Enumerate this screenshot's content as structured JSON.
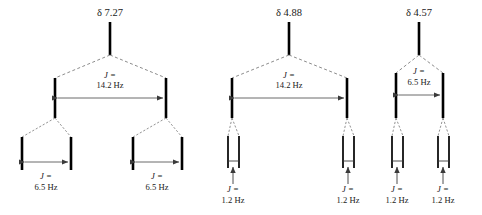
{
  "figure": {
    "kind": "nmr-splitting-tree-diagram",
    "background_color": "#ffffff",
    "line_color": "#000000",
    "dashed_color": "#777777",
    "arrow_color": "#3a3a3a",
    "width": 482,
    "height": 215
  },
  "trees": [
    {
      "id": "tree-1",
      "shift_label": "δ 7.27",
      "shift_x": 110,
      "stem": {
        "x": 110,
        "y1": 22,
        "y2": 55
      },
      "level1": {
        "j_italic": "J",
        "j_equals": "=",
        "j_value": "14.2 Hz",
        "j_line1": "J =",
        "j_line2": "14.2 Hz",
        "label_x": 110,
        "label_y1": 78,
        "label_y2": 88,
        "arrow_y": 98,
        "left_x": 55,
        "right_x": 166,
        "bar_y1": 78,
        "bar_y2": 118
      },
      "level2": [
        {
          "j_line1": "J =",
          "j_line2": "6.5 Hz",
          "label_x": 46,
          "label_y1": 179,
          "label_y2": 190,
          "arrow_y": 162,
          "left_x": 22,
          "right_x": 71,
          "bar_y1": 137,
          "bar_y2": 170
        },
        {
          "j_line1": "J =",
          "j_line2": "6.5 Hz",
          "label_x": 157,
          "label_y1": 179,
          "label_y2": 190,
          "arrow_y": 162,
          "left_x": 133,
          "right_x": 182,
          "bar_y1": 137,
          "bar_y2": 170
        }
      ]
    },
    {
      "id": "tree-2",
      "shift_label": "δ 4.88",
      "shift_x": 289,
      "stem": {
        "x": 289,
        "y1": 22,
        "y2": 55
      },
      "level1": {
        "j_line1": "J =",
        "j_line2": "14.2 Hz",
        "label_x": 289,
        "label_y1": 78,
        "label_y2": 88,
        "arrow_y": 98,
        "left_x": 232,
        "right_x": 347,
        "bar_y1": 78,
        "bar_y2": 118
      },
      "level2": [
        {
          "j_line1": "J =",
          "j_line2": "1.2 Hz",
          "label_x": 233,
          "label_y1": 192,
          "label_y2": 203,
          "arrow_y_top": 168,
          "arrow_y_bottom": 184,
          "left_x": 228,
          "right_x": 239,
          "bar_y1": 136,
          "bar_y2": 168
        },
        {
          "j_line1": "J =",
          "j_line2": "1.2 Hz",
          "label_x": 348,
          "label_y1": 192,
          "label_y2": 203,
          "arrow_y_top": 168,
          "arrow_y_bottom": 184,
          "left_x": 343,
          "right_x": 354,
          "bar_y1": 136,
          "bar_y2": 168
        }
      ]
    },
    {
      "id": "tree-3",
      "shift_label": "δ 4.57",
      "shift_x": 419,
      "stem": {
        "x": 419,
        "y1": 22,
        "y2": 55
      },
      "level1": {
        "j_line1": "J =",
        "j_line2": "6.5 Hz",
        "label_x": 419,
        "label_y1": 74,
        "label_y2": 85,
        "arrow_y": 95,
        "left_x": 396,
        "right_x": 443,
        "bar_y1": 73,
        "bar_y2": 118
      },
      "level2": [
        {
          "j_line1": "J =",
          "j_line2": "1.2 Hz",
          "label_x": 397,
          "label_y1": 192,
          "label_y2": 203,
          "arrow_y_top": 168,
          "arrow_y_bottom": 184,
          "left_x": 392,
          "right_x": 403,
          "bar_y1": 136,
          "bar_y2": 168
        },
        {
          "j_line1": "J =",
          "j_line2": "1.2 Hz",
          "label_x": 443,
          "label_y1": 192,
          "label_y2": 203,
          "arrow_y_top": 168,
          "arrow_y_bottom": 184,
          "left_x": 438,
          "right_x": 449,
          "bar_y1": 136,
          "bar_y2": 168
        }
      ]
    }
  ]
}
